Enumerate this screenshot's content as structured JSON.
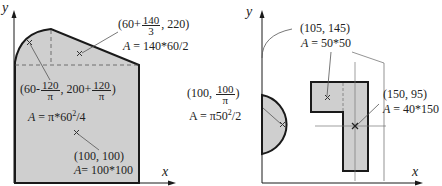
{
  "left_figure": {
    "axis_x": "x",
    "axis_y": "y",
    "triangle": {
      "coord_prefix": "(60+",
      "coord_num": "140",
      "coord_den": "3",
      "coord_suffix": ", 220)",
      "area_var": "A",
      "area_expr": " = 140*60/2"
    },
    "quarter_circle": {
      "coord_prefix": "(60-",
      "coord_num1": "120",
      "coord_den1": "π",
      "coord_mid": ", 200+",
      "coord_num2": "120",
      "coord_den2": "π",
      "coord_suffix": ")",
      "area_var": "A",
      "area_expr": " = π*60",
      "area_sup": "2",
      "area_tail": "/4"
    },
    "square": {
      "coord": "(100, 100)",
      "area_var": "A",
      "area_expr": "= 100*100"
    }
  },
  "right_figure": {
    "axis_x": "x",
    "axis_y": "y",
    "semicircle": {
      "coord_prefix": "(100, ",
      "coord_num": "100",
      "coord_den": "π",
      "coord_suffix": ")",
      "area_expr": "A = π50",
      "area_sup": "2",
      "area_tail": "/2"
    },
    "small_square": {
      "coord": "(105, 145)",
      "area_var": "A",
      "area_expr": " = 50*50"
    },
    "tall_rect": {
      "coord": "(150, 95)",
      "area_var": "A",
      "area_expr": " = 40*150"
    }
  },
  "colors": {
    "fill": "#cfcfcf",
    "stroke": "#1a1a1a",
    "leader": "#555555"
  }
}
